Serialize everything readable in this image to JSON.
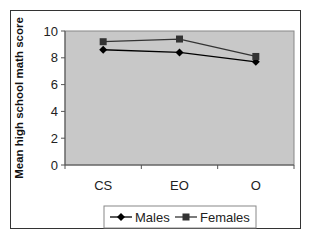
{
  "chart_data": {
    "type": "line",
    "title": "",
    "xlabel": "",
    "ylabel": "Mean high school math score",
    "categories": [
      "CS",
      "EO",
      "O"
    ],
    "series": [
      {
        "name": "Males",
        "marker": "diamond",
        "color": "#000000",
        "values": [
          8.6,
          8.4,
          7.7
        ]
      },
      {
        "name": "Females",
        "marker": "square",
        "color": "#333333",
        "values": [
          9.2,
          9.4,
          8.1
        ]
      }
    ],
    "ylim": [
      0,
      10
    ],
    "yticks": [
      0,
      2,
      4,
      6,
      8,
      10
    ],
    "grid": false,
    "plot_background": "#c8c8c8",
    "legend_position": "bottom"
  },
  "legend": {
    "items": [
      {
        "label": "Males"
      },
      {
        "label": "Females"
      }
    ]
  }
}
